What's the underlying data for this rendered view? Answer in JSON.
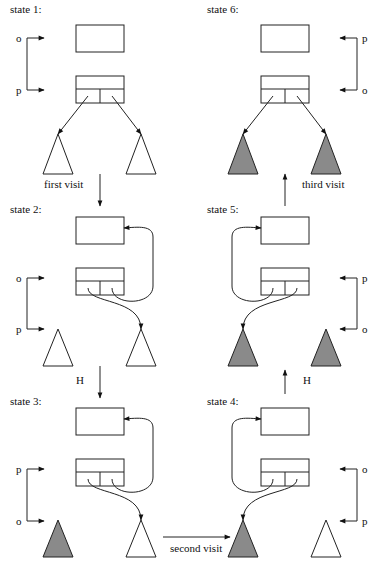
{
  "diagram": {
    "colors": {
      "stroke": "#222222",
      "visited_fill": "#8a8a8a",
      "unvisited_fill": "#ffffff"
    },
    "states": [
      {
        "id": 1,
        "label": "state 1:",
        "label_pos": [
          10,
          13
        ],
        "parent_box": [
          76,
          25,
          48,
          27
        ],
        "node_box": [
          76,
          76,
          48,
          27
        ],
        "ptr_side": "left",
        "ptr_top_label": "o",
        "ptr_bottom_label": "p",
        "ptr_top_y": 38,
        "ptr_bottom_y": 90,
        "triangles": [
          {
            "x": 58,
            "fill": "white"
          },
          {
            "x": 141,
            "fill": "white"
          }
        ],
        "tri_top": 134,
        "tri_base": 174,
        "links": "down"
      },
      {
        "id": 2,
        "label": "state 2:",
        "label_pos": [
          10,
          213
        ],
        "parent_box": [
          76,
          217,
          48,
          27
        ],
        "node_box": [
          76,
          268,
          48,
          27
        ],
        "ptr_side": "left",
        "ptr_top_label": "o",
        "ptr_bottom_label": "p",
        "ptr_top_y": 278,
        "ptr_bottom_y": 329,
        "triangles": [
          {
            "x": 58,
            "fill": "white"
          },
          {
            "x": 141,
            "fill": "white"
          }
        ],
        "tri_top": 329,
        "tri_base": 366,
        "links": "reversed-right"
      },
      {
        "id": 3,
        "label": "state 3:",
        "label_pos": [
          10,
          405
        ],
        "parent_box": [
          76,
          408,
          48,
          27
        ],
        "node_box": [
          76,
          459,
          48,
          27
        ],
        "ptr_side": "left",
        "ptr_top_label": "p",
        "ptr_bottom_label": "o",
        "ptr_top_y": 469,
        "ptr_bottom_y": 521,
        "triangles": [
          {
            "x": 58,
            "fill": "gray"
          },
          {
            "x": 141,
            "fill": "white"
          }
        ],
        "tri_top": 520,
        "tri_base": 557,
        "links": "reversed-right"
      },
      {
        "id": 4,
        "label": "state 4:",
        "label_pos": [
          207,
          405
        ],
        "parent_box": [
          261,
          408,
          48,
          27
        ],
        "node_box": [
          261,
          459,
          48,
          27
        ],
        "ptr_side": "right",
        "ptr_top_label": "o",
        "ptr_bottom_label": "p",
        "ptr_top_y": 469,
        "ptr_bottom_y": 521,
        "triangles": [
          {
            "x": 243,
            "fill": "gray"
          },
          {
            "x": 326,
            "fill": "white"
          }
        ],
        "tri_top": 520,
        "tri_base": 557,
        "links": "reversed-left"
      },
      {
        "id": 5,
        "label": "state 5:",
        "label_pos": [
          207,
          213
        ],
        "parent_box": [
          261,
          217,
          48,
          27
        ],
        "node_box": [
          261,
          268,
          48,
          27
        ],
        "ptr_side": "right",
        "ptr_top_label": "p",
        "ptr_bottom_label": "o",
        "ptr_top_y": 278,
        "ptr_bottom_y": 329,
        "triangles": [
          {
            "x": 243,
            "fill": "gray"
          },
          {
            "x": 326,
            "fill": "gray"
          }
        ],
        "tri_top": 329,
        "tri_base": 366,
        "links": "reversed-left"
      },
      {
        "id": 6,
        "label": "state 6:",
        "label_pos": [
          207,
          13
        ],
        "parent_box": [
          261,
          25,
          48,
          27
        ],
        "node_box": [
          261,
          76,
          48,
          27
        ],
        "ptr_side": "right",
        "ptr_top_label": "p",
        "ptr_bottom_label": "o",
        "ptr_top_y": 38,
        "ptr_bottom_y": 90,
        "triangles": [
          {
            "x": 243,
            "fill": "gray"
          },
          {
            "x": 326,
            "fill": "gray"
          }
        ],
        "tri_top": 134,
        "tri_base": 174,
        "links": "down"
      }
    ],
    "transitions": [
      {
        "from": 1,
        "to": 2,
        "label": "first visit",
        "dir": "down",
        "x": 100,
        "y1": 174,
        "y2": 206,
        "label_pos": [
          44,
          188
        ]
      },
      {
        "from": 2,
        "to": 3,
        "label": "H",
        "dir": "down",
        "x": 100,
        "y1": 366,
        "y2": 398,
        "label_pos": [
          76,
          384
        ]
      },
      {
        "from": 3,
        "to": 4,
        "label": "second visit",
        "dir": "right",
        "y": 537,
        "x1": 163,
        "x2": 230,
        "label_pos": [
          170,
          552
        ]
      },
      {
        "from": 4,
        "to": 5,
        "label": "H",
        "dir": "up",
        "x": 285,
        "y1": 394,
        "y2": 370,
        "label_pos": [
          303,
          384
        ]
      },
      {
        "from": 5,
        "to": 6,
        "label": "third visit",
        "dir": "up",
        "x": 285,
        "y1": 206,
        "y2": 174,
        "label_pos": [
          302,
          188
        ]
      }
    ]
  }
}
